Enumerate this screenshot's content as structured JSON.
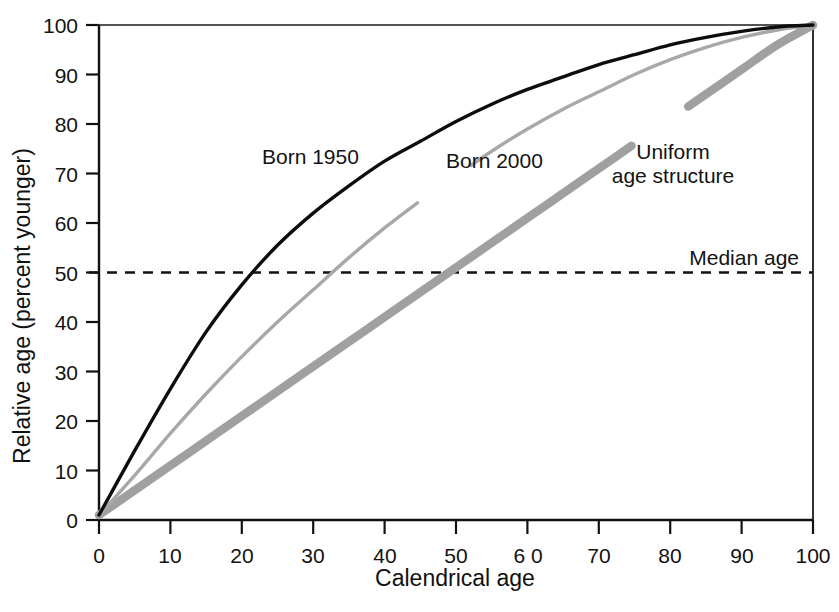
{
  "chart_data": {
    "type": "line",
    "title": "",
    "subtitle": "",
    "xlabel": "Calendrical age",
    "ylabel": "Relative age (percent younger)",
    "xlim": [
      0,
      100
    ],
    "ylim": [
      0,
      100
    ],
    "xticks": [
      0,
      10,
      20,
      30,
      40,
      50,
      60,
      70,
      80,
      90,
      100
    ],
    "xtick_labels": [
      "0",
      "10",
      "20",
      "30",
      "40",
      "50",
      "6 0",
      "70",
      "80",
      "90",
      "100"
    ],
    "yticks": [
      0,
      10,
      20,
      30,
      40,
      50,
      60,
      70,
      80,
      90,
      100
    ],
    "ytick_labels": [
      "0",
      "10",
      "20",
      "30",
      "40",
      "50",
      "60",
      "70",
      "80",
      "90",
      "100"
    ],
    "grid": false,
    "legend_position": "inline-annotations",
    "x": [
      0,
      5,
      10,
      15,
      20,
      25,
      30,
      35,
      40,
      45,
      50,
      55,
      60,
      65,
      70,
      75,
      80,
      85,
      90,
      95,
      100
    ],
    "series": [
      {
        "name": "Born 1950",
        "color": "#0d0d0d",
        "line_width": 3.4,
        "values": [
          1,
          14,
          26.5,
          38,
          47.5,
          55.5,
          62,
          67.5,
          72.5,
          76.5,
          80.5,
          84,
          87,
          89.5,
          92,
          94,
          96,
          97.5,
          98.7,
          99.6,
          100
        ],
        "median_crossing_x": 22,
        "label_x": 27,
        "label_y": 73
      },
      {
        "name": "Born 2000",
        "color": "#a8a8a8",
        "line_width": 3.4,
        "values": [
          1,
          9,
          17.5,
          25.5,
          33,
          40,
          46.5,
          53,
          59,
          64.5,
          69.5,
          74.5,
          79,
          83,
          86.5,
          90,
          93,
          95.5,
          97.5,
          99,
          100
        ],
        "median_crossing_x": 32.5,
        "label_x": 49,
        "label_y": 72
      },
      {
        "name": "Uniform age structure",
        "color": "#a0a0a0",
        "line_width": 8.5,
        "values": [
          1,
          6,
          11,
          16,
          21,
          26,
          31,
          36,
          41,
          46,
          51,
          56,
          61,
          66,
          71,
          76,
          81,
          86,
          91,
          96,
          100
        ],
        "median_crossing_x": 48.5,
        "label_x": 80,
        "label_y": 78
      }
    ],
    "reference_lines": [
      {
        "name": "Median age",
        "orientation": "horizontal",
        "value": 50,
        "style": "dashed",
        "color": "#111111",
        "label": "Median age"
      }
    ],
    "annotations": [
      {
        "text": "Born 1950",
        "x": 27,
        "y": 74
      },
      {
        "text": "Born 2000",
        "x": 49,
        "y": 73
      },
      {
        "text": "Uniform",
        "x": 80,
        "y": 79
      },
      {
        "text": "age structure",
        "x": 80,
        "y": 75
      },
      {
        "text": "Median age",
        "x": 94,
        "y": 55
      }
    ]
  },
  "axes": {
    "x_title": "Calendrical age",
    "y_title": "Relative age (percent younger)"
  },
  "labels": {
    "born_1950": "Born 1950",
    "born_2000": "Born 2000",
    "uniform_line1": "Uniform",
    "uniform_line2": "age structure",
    "median_age": "Median age"
  },
  "colors": {
    "axis": "#111111",
    "born_1950": "#0d0d0d",
    "born_2000": "#a8a8a8",
    "uniform": "#a0a0a0",
    "median_line": "#111111",
    "background": "#ffffff"
  }
}
